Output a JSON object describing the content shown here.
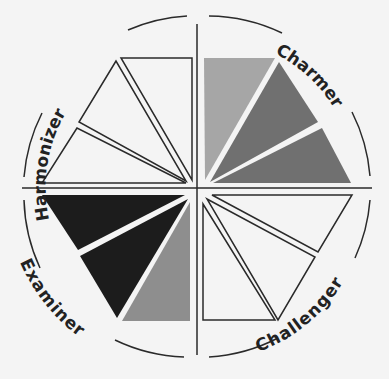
{
  "quadrants": [
    {
      "name": "Harmonizer",
      "position": "top-left",
      "fill": "none"
    },
    {
      "name": "Charmer",
      "position": "top-right",
      "fill": "gray"
    },
    {
      "name": "Examiner",
      "position": "bottom-left",
      "fill": "black"
    },
    {
      "name": "Challenger",
      "position": "bottom-right",
      "fill": "none"
    }
  ],
  "colors": {
    "background": "#f4f4f4",
    "line": "#2a2a2a",
    "charmer_light": "#a6a6a6",
    "charmer_dark": "#707070",
    "examiner_dark": "#1c1c1c",
    "examiner_light": "#8e8e8e"
  }
}
